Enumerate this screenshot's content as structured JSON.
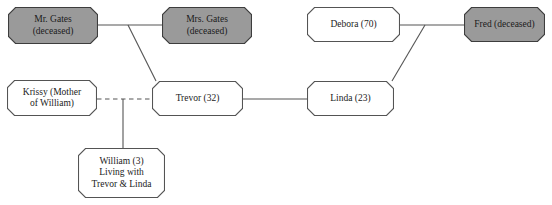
{
  "diagram": {
    "colors": {
      "deceased_fill": "#9a9a9a",
      "alive_fill": "#ffffff",
      "stroke": "#545454",
      "deceased_stroke": "#3d3d3d",
      "text": "#1b1b1b",
      "background": "#ffffff"
    },
    "nodes": [
      {
        "id": "mr-gates",
        "label": "Mr. Gates\n(deceased)",
        "status": "deceased",
        "x": 8,
        "y": 7,
        "w": 90,
        "h": 37,
        "font": 9.5
      },
      {
        "id": "mrs-gates",
        "label": "Mrs. Gates\n(deceased)",
        "status": "deceased",
        "x": 162,
        "y": 7,
        "w": 90,
        "h": 37,
        "font": 9.5
      },
      {
        "id": "debora",
        "label": "Debora (70)",
        "status": "living",
        "x": 307,
        "y": 7,
        "w": 93,
        "h": 35,
        "font": 9.5
      },
      {
        "id": "fred",
        "label": "Fred (deceased)",
        "status": "deceased",
        "x": 464,
        "y": 7,
        "w": 81,
        "h": 35,
        "font": 9.5
      },
      {
        "id": "krissy",
        "label": "Krissy (Mother\nof William)",
        "status": "living",
        "x": 7,
        "y": 80,
        "w": 90,
        "h": 36,
        "font": 9.5
      },
      {
        "id": "trevor",
        "label": "Trevor (32)",
        "status": "living",
        "x": 152,
        "y": 81,
        "w": 91,
        "h": 35,
        "font": 9.5
      },
      {
        "id": "linda",
        "label": "Linda (23)",
        "status": "living",
        "x": 307,
        "y": 81,
        "w": 87,
        "h": 35,
        "font": 9.5
      },
      {
        "id": "william",
        "label": "William (3)\nLiving with\nTrevor & Linda",
        "status": "living",
        "x": 78,
        "y": 148,
        "w": 87,
        "h": 50,
        "font": 9.5
      }
    ],
    "edges": [
      {
        "id": "gates-marriage",
        "from": "mr-gates",
        "to": "mrs-gates",
        "style": "solid",
        "kind": "partner",
        "points": [
          [
            98,
            25
          ],
          [
            162,
            25
          ]
        ]
      },
      {
        "id": "gates-to-trevor",
        "from": "gates-marriage",
        "to": "trevor",
        "style": "solid",
        "kind": "child",
        "points": [
          [
            128,
            25
          ],
          [
            156,
            81
          ]
        ]
      },
      {
        "id": "debora-fred-marriage",
        "from": "debora",
        "to": "fred",
        "style": "solid",
        "kind": "partner",
        "points": [
          [
            400,
            25
          ],
          [
            464,
            25
          ]
        ]
      },
      {
        "id": "debora-fred-to-linda",
        "from": "debora-fred-marriage",
        "to": "linda",
        "style": "solid",
        "kind": "child",
        "points": [
          [
            425,
            25
          ],
          [
            392,
            81
          ]
        ]
      },
      {
        "id": "trevor-linda-partner",
        "from": "trevor",
        "to": "linda",
        "style": "solid",
        "kind": "partner",
        "points": [
          [
            243,
            99
          ],
          [
            307,
            99
          ]
        ]
      },
      {
        "id": "krissy-trevor-dashed",
        "from": "krissy",
        "to": "trevor",
        "style": "dashed",
        "kind": "former-partner",
        "points": [
          [
            97,
            99
          ],
          [
            152,
            99
          ]
        ]
      },
      {
        "id": "krissy-trevor-to-william",
        "from": "krissy-trevor-dashed",
        "to": "william",
        "style": "solid",
        "kind": "child",
        "points": [
          [
            123,
            99
          ],
          [
            123,
            148
          ]
        ]
      }
    ]
  }
}
